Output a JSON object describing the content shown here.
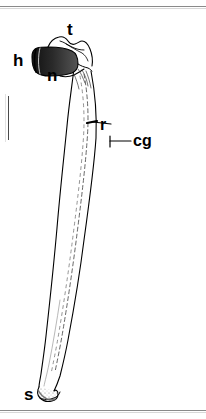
{
  "figure": {
    "kind": "anatomical-line-drawing",
    "ink_color": "#000000",
    "background_color": "#ffffff",
    "rule_color": "#8a8a8a",
    "labels": [
      {
        "key": "t",
        "text": "t",
        "meaning": "tubercle / dorsal process at proximal end"
      },
      {
        "key": "h",
        "text": "h",
        "meaning": "head (proximal base)"
      },
      {
        "key": "n",
        "text": "n",
        "meaning": "neck"
      },
      {
        "key": "r",
        "text": "r",
        "meaning": "ring / transverse marking on shaft"
      },
      {
        "key": "cg",
        "text": "cg",
        "meaning": "cartilaginous core / growth zone"
      },
      {
        "key": "s",
        "text": "s",
        "meaning": "shaft distal tip"
      }
    ]
  }
}
